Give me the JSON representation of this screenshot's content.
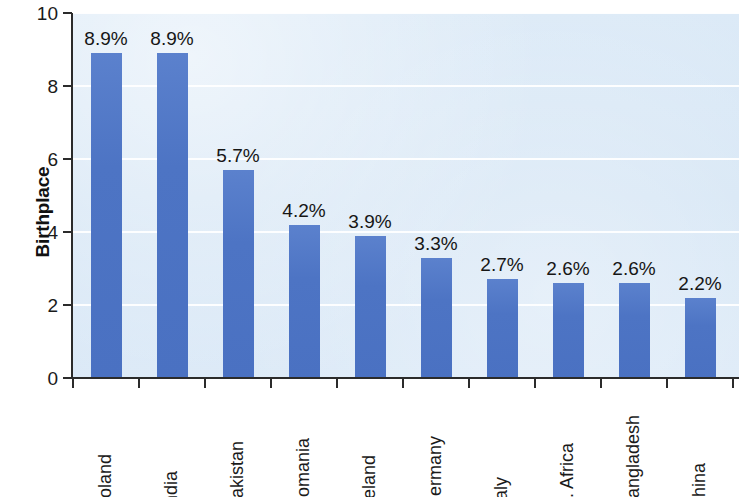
{
  "chart_data": {
    "type": "bar",
    "title": "",
    "subtitle": "",
    "xlabel": "",
    "ylabel": "Birthplace",
    "categories": [
      "Poland",
      "India",
      "Pakistan",
      "Romania",
      "Ireland",
      "Germany",
      "Italy",
      "S. Africa",
      "Bangladesh",
      "China"
    ],
    "values": [
      8.9,
      8.9,
      5.7,
      4.2,
      3.9,
      3.3,
      2.7,
      2.6,
      2.6,
      2.2
    ],
    "value_labels": [
      "8.9%",
      "8.9%",
      "5.7%",
      "4.2%",
      "3.9%",
      "3.3%",
      "2.7%",
      "2.6%",
      "2.6%",
      "2.2%"
    ],
    "ylim": [
      0,
      10
    ],
    "ytick_values": [
      0,
      2,
      4,
      6,
      8,
      10
    ],
    "ytick_labels": [
      "0",
      "2",
      "4",
      "6",
      "8",
      "10"
    ],
    "grid": true,
    "grid_axis": "y",
    "legend": false,
    "legend_position": "none",
    "units": "percent",
    "colors": {
      "bar": "#4e76c6",
      "plot_background": "#d9e8f6",
      "gridline": "#ffffff",
      "axis": "#2b2b2b",
      "text": "#1a1a1a",
      "figure_background": "#ffffff"
    }
  }
}
